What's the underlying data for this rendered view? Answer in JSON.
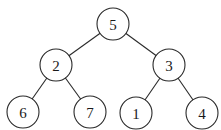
{
  "diagram": {
    "type": "binary-tree",
    "node_radius": 16,
    "colors": {
      "stroke": "#2a2a2a",
      "fill": "#ffffff",
      "text": "#1a1a1a"
    },
    "nodes": [
      {
        "id": "n5",
        "label": "5",
        "x": 113,
        "y": 24
      },
      {
        "id": "n2",
        "label": "2",
        "x": 56,
        "y": 65
      },
      {
        "id": "n3",
        "label": "3",
        "x": 169,
        "y": 65
      },
      {
        "id": "n6",
        "label": "6",
        "x": 23,
        "y": 112
      },
      {
        "id": "n7",
        "label": "7",
        "x": 90,
        "y": 112
      },
      {
        "id": "n1",
        "label": "1",
        "x": 136,
        "y": 113
      },
      {
        "id": "n4",
        "label": "4",
        "x": 202,
        "y": 113
      }
    ],
    "edges": [
      {
        "from": "n5",
        "to": "n2"
      },
      {
        "from": "n5",
        "to": "n3"
      },
      {
        "from": "n2",
        "to": "n6"
      },
      {
        "from": "n2",
        "to": "n7"
      },
      {
        "from": "n3",
        "to": "n1"
      },
      {
        "from": "n3",
        "to": "n4"
      }
    ]
  }
}
